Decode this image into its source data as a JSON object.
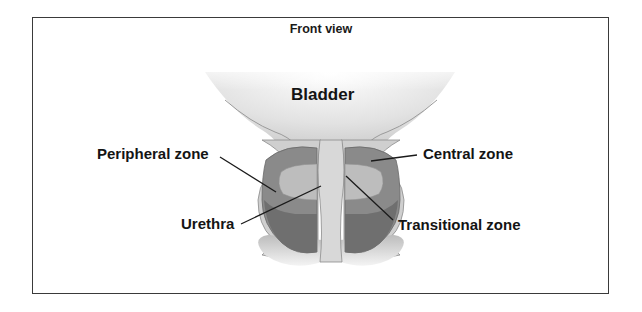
{
  "diagram": {
    "title": "Front view",
    "labels": {
      "bladder": "Bladder",
      "peripheral_zone": "Peripheral zone",
      "central_zone": "Central zone",
      "urethra": "Urethra",
      "transitional_zone": "Transitional zone"
    },
    "colors": {
      "border": "#3a3a3a",
      "bladder_fill": "#e4e4e4",
      "capsule_fill": "#c9c9c9",
      "central_zone": "#8a8a8a",
      "transitional_zone": "#bdbdbd",
      "peripheral_zone": "#6e6e6e",
      "urethra": "#d6d6d6",
      "leader_line": "#1a1a1a"
    }
  }
}
